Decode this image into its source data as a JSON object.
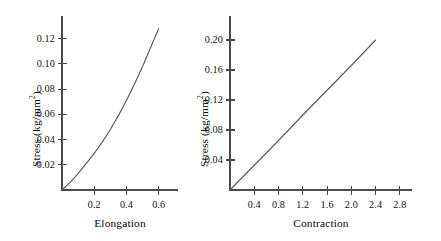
{
  "figure": {
    "background_color": "#ffffff",
    "axis_color": "#4a4a4a",
    "curve_color": "#5a5a5a",
    "text_color": "#111111"
  },
  "chart_data": [
    {
      "type": "line",
      "panel": "left",
      "title": "",
      "xlabel": "Elongation",
      "ylabel_parts": {
        "main": "Stress (kg/mm",
        "exponent": "2",
        "tail": ")"
      },
      "ylabel": "Stress (kg/mm2)",
      "xticks": [
        0.2,
        0.4,
        0.6
      ],
      "xtick_labels": [
        "0.2",
        "0.4",
        "0.6"
      ],
      "yticks": [
        0.02,
        0.04,
        0.06,
        0.08,
        0.1,
        0.12
      ],
      "ytick_labels": [
        "0.02",
        "0.04",
        "0.06",
        "0.08",
        "0.10",
        "0.12"
      ],
      "xlim": [
        0.0,
        0.72
      ],
      "ylim": [
        0.0,
        0.138
      ],
      "grid": false,
      "legend": false,
      "series": [
        {
          "name": "stress-elongation",
          "shape": "convex-increasing",
          "x": [
            0.0,
            0.05,
            0.1,
            0.15,
            0.2,
            0.25,
            0.3,
            0.35,
            0.4,
            0.45,
            0.5,
            0.55,
            0.6
          ],
          "y": [
            0.0,
            0.006,
            0.013,
            0.021,
            0.029,
            0.038,
            0.048,
            0.059,
            0.071,
            0.084,
            0.098,
            0.113,
            0.128
          ]
        }
      ]
    },
    {
      "type": "line",
      "panel": "right",
      "title": "",
      "xlabel": "Contraction",
      "ylabel_parts": {
        "main": "Stress (kg/mm",
        "exponent": "2",
        "tail": ")"
      },
      "ylabel": "Stress (kg/mm2)",
      "xticks": [
        0.4,
        0.8,
        1.2,
        1.6,
        2.0,
        2.4,
        2.8
      ],
      "xtick_labels": [
        "0.4",
        "0.8",
        "1.2",
        "1.6",
        "2.0",
        "2.4",
        "2.8"
      ],
      "yticks": [
        0.04,
        0.08,
        0.12,
        0.16,
        0.2
      ],
      "ytick_labels": [
        "0.04",
        "0.08",
        "0.12",
        "0.16",
        "0.20"
      ],
      "xlim": [
        0.0,
        3.0
      ],
      "ylim": [
        0.0,
        0.232
      ],
      "grid": false,
      "legend": false,
      "series": [
        {
          "name": "stress-contraction",
          "shape": "linear-increasing",
          "x": [
            0.0,
            0.4,
            0.8,
            1.2,
            1.6,
            2.0,
            2.4
          ],
          "y": [
            0.0,
            0.033,
            0.066,
            0.1,
            0.133,
            0.166,
            0.2
          ]
        }
      ]
    }
  ]
}
